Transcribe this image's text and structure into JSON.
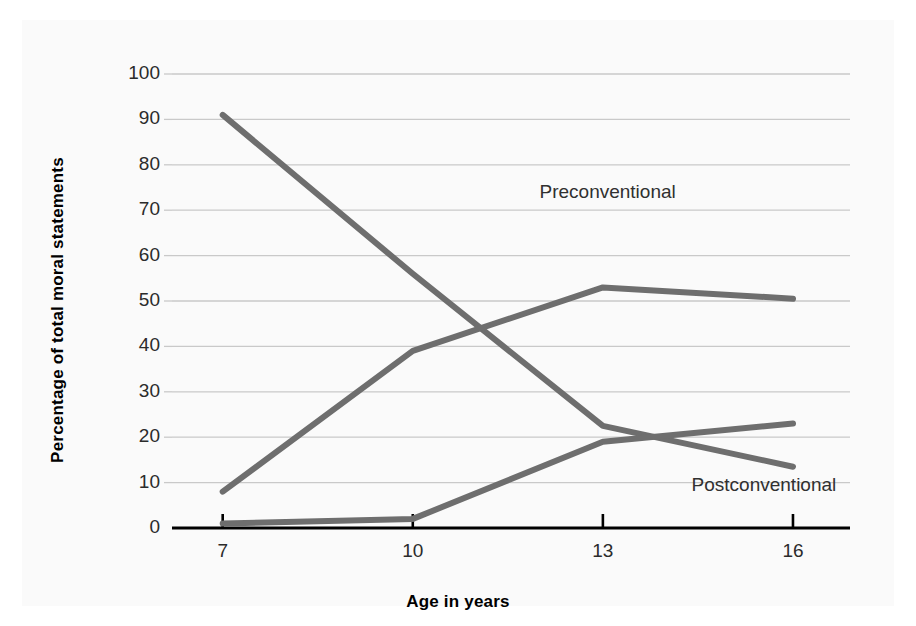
{
  "chart_data": {
    "type": "line",
    "title": "",
    "xlabel": "Age in years",
    "ylabel": "Percentage of total moral statements",
    "x": [
      7,
      10,
      13,
      16
    ],
    "categories": [
      "7",
      "10",
      "13",
      "16"
    ],
    "xlim": [
      6.2,
      16.9
    ],
    "ylim": [
      0,
      100
    ],
    "ytick_labels": [
      "0",
      "10",
      "20",
      "30",
      "40",
      "50",
      "60",
      "70",
      "80",
      "90",
      "100"
    ],
    "ytick_values": [
      0,
      10,
      20,
      30,
      40,
      50,
      60,
      70,
      80,
      90,
      100
    ],
    "grid": "horizontal",
    "legend": "inline-labels",
    "series": [
      {
        "name": "Preconventional",
        "label": "Preconventional",
        "color": "#6e6e6e",
        "values": [
          91,
          56,
          22.5,
          13.5
        ],
        "label_x": 12.0,
        "label_y": 73.5
      },
      {
        "name": "Conventional",
        "label": "Conventional",
        "color": "#6e6e6e",
        "values": [
          8,
          39,
          53,
          50.5
        ],
        "label_x": 18.4,
        "label_y": 58.0
      },
      {
        "name": "Postconventional",
        "label": "Postconventional",
        "color": "#6e6e6e",
        "values": [
          1,
          2,
          19,
          23
        ],
        "label_x": 14.4,
        "label_y": 9.0
      }
    ],
    "colors": {
      "line": "#6e6e6e",
      "gridline": "#c9c9c9",
      "axis": "#000000",
      "background": "#fafafa",
      "text": "#2b2b2b"
    }
  }
}
